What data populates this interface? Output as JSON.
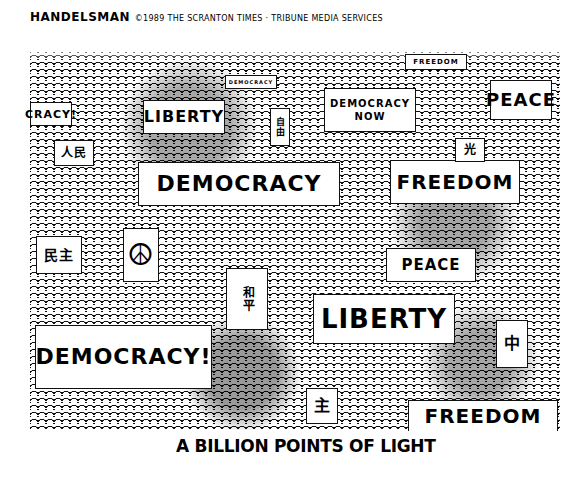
{
  "cartoon": {
    "artist_signature": "HANDELSMAN",
    "credit": "©1989 THE SCRANTON TIMES · TRIBUNE MEDIA SERVICES",
    "caption": "A BILLION POINTS OF LIGHT",
    "signs": [
      {
        "text": "FREEDOM",
        "position": "top-right-small"
      },
      {
        "text": "DEMOCRACY",
        "position": "top-center-small"
      },
      {
        "text": "CRACY!",
        "position": "left-upper"
      },
      {
        "text": "LIBERTY",
        "position": "upper-left-center"
      },
      {
        "text": "DEMOCRACY NOW",
        "position": "upper-center-right"
      },
      {
        "text": "PEACE",
        "position": "upper-right"
      },
      {
        "text": "DEMOCRACY",
        "position": "center"
      },
      {
        "text": "FREEDOM",
        "position": "center-right"
      },
      {
        "text": "☮",
        "position": "left-middle"
      },
      {
        "text": "PEACE",
        "position": "right-middle"
      },
      {
        "text": "LIBERTY",
        "position": "center-lower"
      },
      {
        "text": "DEMOCRACY!",
        "position": "lower-left"
      },
      {
        "text": "FREEDOM",
        "position": "bottom-right"
      }
    ],
    "glyph_signs": [
      "人民",
      "自由",
      "民主",
      "和平",
      "中",
      "光",
      "主"
    ]
  }
}
